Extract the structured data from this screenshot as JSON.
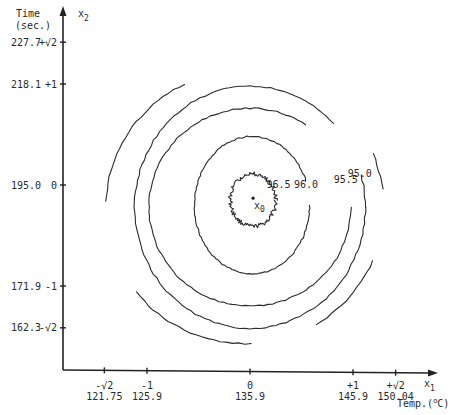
{
  "chart_data": {
    "type": "contour",
    "title": "",
    "xaxis": {
      "variable": "x1",
      "label": "Temp.(°C)",
      "label_text": "Temp.(",
      "label_sup": "o",
      "label_end": "C)",
      "coded_range": [
        -1.414,
        1.414
      ],
      "ticks": [
        {
          "coded": -1.414,
          "coded_label": "-√2",
          "actual_label": "121.75",
          "actual": 121.75
        },
        {
          "coded": -1,
          "coded_label": "-1",
          "actual_label": "125.9",
          "actual": 125.9
        },
        {
          "coded": 0,
          "coded_label": "0",
          "actual_label": "135.9",
          "actual": 135.9
        },
        {
          "coded": 1,
          "coded_label": "+1",
          "actual_label": "145.9",
          "actual": 145.9
        },
        {
          "coded": 1.414,
          "coded_label": "+√2",
          "actual_label": "150.04",
          "actual": 150.04
        }
      ]
    },
    "yaxis": {
      "variable": "x2",
      "label_line1": "Time",
      "label_line2": "(sec.)",
      "coded_range": [
        -1.414,
        1.414
      ],
      "ticks": [
        {
          "coded": 1.414,
          "coded_label": "+√2",
          "actual_label": "227.7",
          "actual": 227.7
        },
        {
          "coded": 1,
          "coded_label": "+1",
          "actual_label": "218.1",
          "actual": 218.1
        },
        {
          "coded": 0,
          "coded_label": "0",
          "actual_label": "195.0",
          "actual": 195.0
        },
        {
          "coded": -1,
          "coded_label": "-1",
          "actual_label": "171.9",
          "actual": 171.9
        },
        {
          "coded": -1.414,
          "coded_label": "-√2",
          "actual_label": "162.3",
          "actual": 162.3
        }
      ]
    },
    "axis_symbols": {
      "x": "x",
      "x_sub": "1",
      "y": "x",
      "y_sub": "2"
    },
    "stationary_point": {
      "label": "x",
      "sub": "0",
      "x_coded": 0.03,
      "y_coded": -0.13
    },
    "contours": [
      {
        "level": 96.5,
        "label": "96.5",
        "center": [
          0.03,
          -0.15
        ],
        "rx": 0.22,
        "ry": 0.26
      },
      {
        "level": 96.0,
        "label": "96.0",
        "center": [
          0.02,
          -0.2
        ],
        "rx": 0.56,
        "ry": 0.68
      },
      {
        "level": 95.5,
        "label": "95.5",
        "center": [
          0.0,
          -0.22
        ],
        "rx": 0.98,
        "ry": 0.98
      },
      {
        "level": 95.0,
        "label": "95.0",
        "center": [
          0.0,
          -0.22
        ],
        "rx": 1.12,
        "ry": 1.2
      },
      {
        "level": 94.5,
        "label": "",
        "center": [
          -0.05,
          -0.22
        ],
        "rx": 1.35,
        "ry": 1.35
      }
    ],
    "grid": false,
    "legend": "none"
  }
}
